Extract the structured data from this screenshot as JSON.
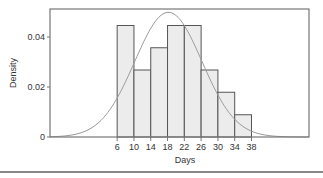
{
  "chart_data": {
    "type": "bar",
    "subtype": "histogram_with_density_curve",
    "title": "",
    "xlabel": "Days",
    "ylabel": "Density",
    "bins": [
      {
        "start": 6,
        "end": 10,
        "density": 0.0446
      },
      {
        "start": 10,
        "end": 14,
        "density": 0.0268
      },
      {
        "start": 14,
        "end": 18,
        "density": 0.0357
      },
      {
        "start": 18,
        "end": 22,
        "density": 0.0446
      },
      {
        "start": 22,
        "end": 26,
        "density": 0.0446
      },
      {
        "start": 26,
        "end": 30,
        "density": 0.0268
      },
      {
        "start": 30,
        "end": 34,
        "density": 0.0179
      },
      {
        "start": 34,
        "end": 38,
        "density": 0.0089
      }
    ],
    "categories": [
      "6-10",
      "10-14",
      "14-18",
      "18-22",
      "22-26",
      "26-30",
      "30-34",
      "34-38"
    ],
    "values": [
      0.0446,
      0.0268,
      0.0357,
      0.0446,
      0.0446,
      0.0268,
      0.0179,
      0.0089
    ],
    "density_curve": {
      "distribution": "normal",
      "mean": 18.2,
      "sd": 8.0,
      "peak": 0.0499
    },
    "xticks": [
      6,
      10,
      14,
      18,
      22,
      26,
      30,
      34,
      38
    ],
    "yticks": [
      {
        "value": 0,
        "label": "0"
      },
      {
        "value": 0.02,
        "label": "0.02"
      },
      {
        "value": 0.04,
        "label": "0.04"
      }
    ],
    "xlim": [
      -10,
      51.7
    ],
    "ylim": [
      0,
      0.0512
    ],
    "grid": false,
    "legend": null,
    "colors": {
      "bar_fill": "#ececec",
      "bar_stroke": "#555555",
      "curve": "#9a9a9a",
      "frame": "#777777"
    }
  }
}
